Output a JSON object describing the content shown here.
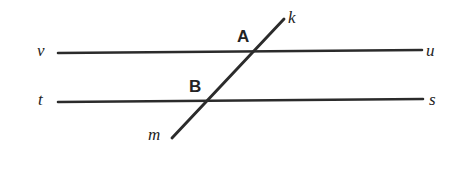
{
  "figure": {
    "background_color": "#ffffff",
    "stroke_color": "#2b2b2b",
    "width": 459,
    "height": 185
  },
  "labels": {
    "line_v": "v",
    "line_u": "u",
    "line_t": "t",
    "line_s": "s",
    "line_k": "k",
    "line_m": "m",
    "point_a": "A",
    "point_b": "B"
  },
  "geometry": {
    "top_line": {
      "name": "line-vu",
      "left_label": "v",
      "right_label": "u",
      "x1": 58,
      "y1": 53,
      "x2": 422,
      "y2": 50
    },
    "bottom_line": {
      "name": "line-ts",
      "left_label": "t",
      "right_label": "s",
      "x1": 58,
      "y1": 102,
      "x2": 423,
      "y2": 99
    },
    "transversal": {
      "name": "line-mk",
      "lower_label": "m",
      "upper_label": "k",
      "x1": 172,
      "y1": 138,
      "x2": 284,
      "y2": 19
    },
    "intersections": [
      {
        "label": "A",
        "on_line": "v u",
        "x": 256,
        "y": 51
      },
      {
        "label": "B",
        "on_line": "t s",
        "x": 207,
        "y": 100
      }
    ]
  }
}
